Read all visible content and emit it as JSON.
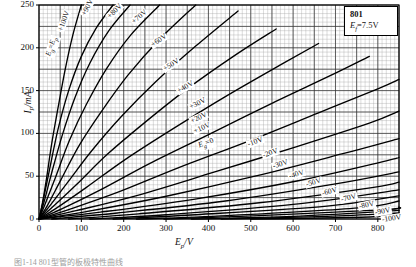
{
  "chart_data": {
    "type": "line",
    "title": "",
    "xlabel": "Ep/V",
    "ylabel": "Ip/mA",
    "xlim": [
      0,
      850
    ],
    "ylim": [
      0,
      250
    ],
    "xticks": [
      0,
      100,
      200,
      300,
      400,
      500,
      600,
      700,
      800
    ],
    "yticks": [
      0,
      50,
      100,
      150,
      200,
      250
    ],
    "grid": true,
    "legend_position": "top-right",
    "annotations": {
      "tube_type": "801",
      "filament": "Ef=7.5V"
    },
    "series": [
      {
        "name": "Eg=Ep",
        "label": "Eg=Ep",
        "grid_volts": null,
        "x": [
          0,
          8,
          18,
          30,
          45,
          62,
          80,
          100
        ],
        "y": [
          0,
          18,
          48,
          88,
          130,
          175,
          215,
          250
        ]
      },
      {
        "name": "+100V",
        "label": "+100V",
        "grid_volts": 100,
        "x": [
          0,
          10,
          25,
          45,
          70,
          100,
          135,
          175
        ],
        "y": [
          0,
          22,
          58,
          105,
          150,
          190,
          223,
          250
        ]
      },
      {
        "name": "+90V",
        "label": "+90V",
        "grid_volts": 90,
        "x": [
          0,
          12,
          30,
          55,
          85,
          120,
          165,
          215
        ],
        "y": [
          0,
          20,
          54,
          98,
          142,
          182,
          220,
          250
        ]
      },
      {
        "name": "+80V",
        "label": "+80V",
        "grid_volts": 80,
        "x": [
          0,
          15,
          40,
          72,
          112,
          160,
          215,
          285
        ],
        "y": [
          0,
          18,
          50,
          92,
          134,
          176,
          214,
          250
        ]
      },
      {
        "name": "+70V",
        "label": "+70V",
        "grid_volts": 70,
        "x": [
          0,
          20,
          52,
          95,
          148,
          210,
          285,
          370
        ],
        "y": [
          0,
          16,
          46,
          86,
          126,
          168,
          210,
          250
        ]
      },
      {
        "name": "+60V",
        "label": "+60V",
        "grid_volts": 60,
        "x": [
          0,
          25,
          68,
          125,
          195,
          275,
          370,
          470
        ],
        "y": [
          0,
          15,
          43,
          80,
          120,
          160,
          202,
          243
        ]
      },
      {
        "name": "+50V",
        "label": "+50V",
        "grid_volts": 50,
        "x": [
          0,
          32,
          88,
          160,
          248,
          350,
          465,
          560
        ],
        "y": [
          0,
          14,
          40,
          75,
          112,
          152,
          192,
          222
        ]
      },
      {
        "name": "+40V",
        "label": "+40V",
        "grid_volts": 40,
        "x": [
          0,
          42,
          112,
          205,
          315,
          440,
          570,
          660
        ],
        "y": [
          0,
          13,
          37,
          70,
          105,
          143,
          180,
          205
        ]
      },
      {
        "name": "+30V",
        "label": "+30V",
        "grid_volts": 30,
        "x": [
          0,
          55,
          145,
          262,
          398,
          545,
          690,
          780
        ],
        "y": [
          0,
          12,
          34,
          65,
          98,
          134,
          168,
          190
        ]
      },
      {
        "name": "+20V",
        "label": "+20V",
        "grid_volts": 20,
        "x": [
          0,
          70,
          185,
          330,
          495,
          660,
          800,
          850
        ],
        "y": [
          0,
          11,
          31,
          60,
          91,
          124,
          152,
          163
        ]
      },
      {
        "name": "+10V",
        "label": "+10V",
        "grid_volts": 10,
        "x": [
          0,
          90,
          235,
          415,
          605,
          780,
          850
        ],
        "y": [
          0,
          10,
          28,
          55,
          84,
          112,
          126
        ]
      },
      {
        "name": "Eg=0",
        "label": "Eg=0",
        "grid_volts": 0,
        "x": [
          0,
          115,
          295,
          510,
          715,
          850
        ],
        "y": [
          0,
          9,
          26,
          50,
          76,
          94
        ]
      },
      {
        "name": "-10V",
        "label": "-10V",
        "grid_volts": -10,
        "x": [
          0,
          145,
          365,
          615,
          820,
          850
        ],
        "y": [
          0,
          8,
          23,
          45,
          68,
          72
        ]
      },
      {
        "name": "-20V",
        "label": "-20V",
        "grid_volts": -20,
        "x": [
          30,
          185,
          440,
          700,
          850
        ],
        "y": [
          0,
          7,
          21,
          41,
          55
        ]
      },
      {
        "name": "-30V",
        "label": "-30V",
        "grid_volts": -30,
        "x": [
          70,
          235,
          520,
          790,
          850
        ],
        "y": [
          0,
          6,
          19,
          37,
          43
        ]
      },
      {
        "name": "-40V",
        "label": "-40V",
        "grid_volts": -40,
        "x": [
          120,
          300,
          600,
          850
        ],
        "y": [
          0,
          5,
          17,
          34
        ]
      },
      {
        "name": "-50V",
        "label": "-50V",
        "grid_volts": -50,
        "x": [
          175,
          370,
          680,
          850
        ],
        "y": [
          0,
          5,
          15,
          27
        ]
      },
      {
        "name": "-60V",
        "label": "-60V",
        "grid_volts": -60,
        "x": [
          230,
          445,
          755,
          850
        ],
        "y": [
          0,
          4,
          13,
          21
        ]
      },
      {
        "name": "-70V",
        "label": "-70V",
        "grid_volts": -70,
        "x": [
          295,
          520,
          820,
          850
        ],
        "y": [
          0,
          4,
          11,
          14
        ]
      },
      {
        "name": "-80V",
        "label": "-80V",
        "grid_volts": -80,
        "x": [
          360,
          600,
          850
        ],
        "y": [
          0,
          3,
          10
        ]
      },
      {
        "name": "-90V",
        "label": "-90V",
        "grid_volts": -90,
        "x": [
          430,
          680,
          850
        ],
        "y": [
          0,
          3,
          7
        ]
      },
      {
        "name": "-100V",
        "label": "-100V",
        "grid_volts": -100,
        "x": [
          500,
          760,
          850
        ],
        "y": [
          0,
          2,
          5
        ]
      }
    ]
  },
  "axis": {
    "y_title_main": "I",
    "y_title_sub": "p",
    "y_title_unit": "/mA",
    "x_title_main": "E",
    "x_title_sub": "p",
    "x_title_unit": "/V",
    "xticks": [
      "0",
      "100",
      "200",
      "300",
      "400",
      "500",
      "600",
      "700",
      "800"
    ],
    "yticks": [
      "0",
      "50",
      "100",
      "150",
      "200",
      "250"
    ]
  },
  "legend": {
    "tube": "801",
    "filament_symbol": "E",
    "filament_sub": "f",
    "filament_value": "=7.5V"
  },
  "curve_labels": [
    {
      "text": "E",
      "sub": "g",
      "tail": "=E",
      "tail_sub": "p",
      "x": 49,
      "y": 52,
      "rot": -72
    },
    {
      "text": "+100V",
      "x": 60,
      "y": 28,
      "rot": -70
    },
    {
      "text": "+90V",
      "x": 83,
      "y": 12,
      "rot": -62
    },
    {
      "text": "+80V",
      "x": 108,
      "y": 14,
      "rot": -45
    },
    {
      "text": "+70V",
      "x": 132,
      "y": 19,
      "rot": -40
    },
    {
      "text": "+60V",
      "x": 151,
      "y": 42,
      "rot": -35
    },
    {
      "text": "+50V",
      "x": 163,
      "y": 66,
      "rot": -32
    },
    {
      "text": "+40V",
      "x": 177,
      "y": 88,
      "rot": -30
    },
    {
      "text": "+30V",
      "x": 189,
      "y": 104,
      "rot": -27
    },
    {
      "text": "+20V",
      "x": 190,
      "y": 118,
      "rot": -25
    },
    {
      "text": "+10V",
      "x": 193,
      "y": 128,
      "rot": -23
    },
    {
      "text": "E",
      "sub": "g",
      "tail": "=0",
      "x": 198,
      "y": 142,
      "rot": -20
    },
    {
      "text": "-10V",
      "x": 247,
      "y": 141,
      "rot": -20
    },
    {
      "text": "-20V",
      "x": 262,
      "y": 152,
      "rot": -19
    },
    {
      "text": "-30V",
      "x": 272,
      "y": 163,
      "rot": -18
    },
    {
      "text": "-40V",
      "x": 288,
      "y": 173,
      "rot": -17
    },
    {
      "text": "-50V",
      "x": 305,
      "y": 181,
      "rot": -16
    },
    {
      "text": "-60V",
      "x": 321,
      "y": 190,
      "rot": -15
    },
    {
      "text": "-70V",
      "x": 340,
      "y": 196,
      "rot": -13
    },
    {
      "text": "-80V",
      "x": 358,
      "y": 203,
      "rot": -12
    },
    {
      "text": "-90V",
      "x": 374,
      "y": 209,
      "rot": -10
    },
    {
      "text": "-100V",
      "x": 381,
      "y": 216,
      "rot": -8
    }
  ],
  "caption": "图1-14 801型管的板极特性曲线"
}
